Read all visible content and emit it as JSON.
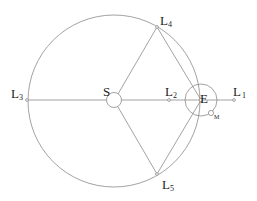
{
  "diagram": {
    "colors": {
      "line": "#8a8a8a",
      "text": "#222222",
      "background": "#ffffff"
    },
    "bodies": {
      "sun": {
        "label": "S"
      },
      "earth": {
        "label": "E"
      },
      "moon": {
        "label": "M"
      }
    },
    "points": {
      "L1": {
        "letter": "L",
        "sub": "1"
      },
      "L2": {
        "letter": "L",
        "sub": "2"
      },
      "L3": {
        "letter": "L",
        "sub": "3"
      },
      "L4": {
        "letter": "L",
        "sub": "4"
      },
      "L5": {
        "letter": "L",
        "sub": "5"
      }
    }
  }
}
